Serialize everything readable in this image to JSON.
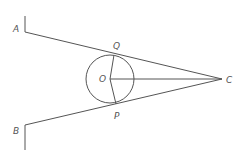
{
  "diagram": {
    "type": "geometry",
    "labels": {
      "A": "A",
      "B": "B",
      "C": "C",
      "O": "O",
      "P": "P",
      "Q": "Q"
    },
    "colors": {
      "stroke": "#555555",
      "background": "#ffffff"
    }
  }
}
